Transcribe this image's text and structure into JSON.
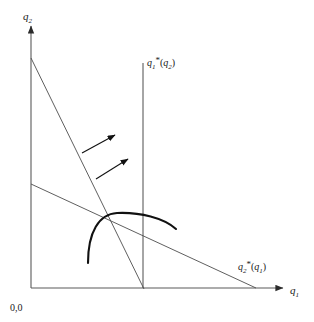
{
  "figure": {
    "name": "cournot-reaction-functions-diagram",
    "background": "#ffffff",
    "ink_color": "#1a1a1a",
    "line_color": "#4d4d4d",
    "width": 314,
    "height": 322
  },
  "axes": {
    "origin_label": "0,0",
    "x_axis": {
      "label_base": "q",
      "label_sub": "1",
      "name": "q1-axis",
      "x_start": 31,
      "x_end": 285,
      "y": 288
    },
    "y_axis": {
      "label_base": "q",
      "label_sub": "2",
      "name": "q2-axis",
      "y_start": 288,
      "y_end": 24,
      "x": 31
    }
  },
  "curves": {
    "firm1_best_response": {
      "label_base": "q",
      "label_sub1": "1",
      "label_star": "*",
      "label_arg_open": "(",
      "label_arg_base": "q",
      "label_arg_sub": "2",
      "label_arg_close": ")",
      "label_text": "q1*(q2)",
      "type": "vertical-line",
      "x": 143,
      "y_top": 63,
      "y_bottom": 288
    },
    "firm2_best_response": {
      "label_base": "q",
      "label_sub1": "2",
      "label_star": "*",
      "label_arg_open": "(",
      "label_arg_base": "q",
      "label_arg_sub": "1",
      "label_arg_close": ")",
      "label_text": "q2*(q1)",
      "type": "downward-sloping-line",
      "x_start": 31,
      "y_start": 184,
      "x_end": 256,
      "y_end": 288
    },
    "steep_line": {
      "type": "downward-sloping-line",
      "x_start": 31,
      "y_start": 58,
      "x_end": 144,
      "y_end": 289
    },
    "isoprofit_arc": {
      "type": "concave-arc",
      "start": [
        88,
        263
      ],
      "peak": [
        116,
        213
      ],
      "end": [
        176,
        228
      ]
    }
  },
  "arrows": [
    {
      "name": "direction-arrow-upper",
      "x1": 82,
      "y1": 153,
      "x2": 118,
      "y2": 133
    },
    {
      "name": "direction-arrow-lower",
      "x1": 96,
      "y1": 179,
      "x2": 131,
      "y2": 157
    }
  ]
}
